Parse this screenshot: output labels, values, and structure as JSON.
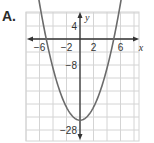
{
  "option": {
    "label": "A."
  },
  "chart_data": {
    "type": "line",
    "title": "",
    "function": "y = x^2 - 25",
    "xlabel": "x",
    "ylabel": "y",
    "xlim": [
      -8,
      8.5
    ],
    "ylim": [
      -32,
      8
    ],
    "grid": true,
    "x_tick_labels": [
      "-6",
      "-2",
      "2",
      "6"
    ],
    "x_ticks": [
      -6,
      -2,
      2,
      6
    ],
    "y_tick_labels": [
      "4",
      "-8",
      "-28"
    ],
    "y_ticks": [
      4,
      -8,
      -28
    ],
    "grid_step_x": 2,
    "grid_step_y": 4,
    "series": [
      {
        "name": "parabola",
        "x": [
          -7,
          -6,
          -5,
          -4,
          -3,
          -2,
          -1,
          0,
          1,
          2,
          3,
          4,
          5,
          6,
          7
        ],
        "values": [
          24,
          11,
          0,
          -9,
          -16,
          -21,
          -24,
          -25,
          -24,
          -21,
          -16,
          -9,
          0,
          11,
          24
        ]
      }
    ],
    "vertex": [
      0,
      -25
    ],
    "roots": [
      -5,
      5
    ],
    "colors": {
      "curve": "#6b6b6b",
      "axis": "#333333",
      "grid": "#d4d4d4"
    }
  }
}
